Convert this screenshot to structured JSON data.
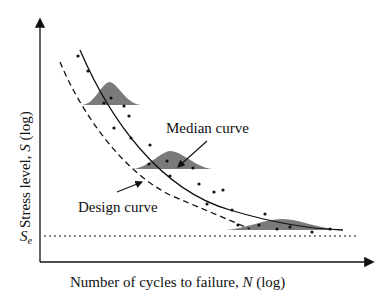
{
  "diagram": {
    "type": "S-N curve (fatigue)",
    "x_axis_label_prefix": "Number of cycles to failure, ",
    "x_axis_var": "N",
    "x_axis_label_suffix": " (log)",
    "y_axis_label_prefix": "Stress level, ",
    "y_axis_var": "S",
    "y_axis_label_suffix": " (log)",
    "endurance_limit_label": "S",
    "endurance_limit_sub": "e",
    "median_curve_label": "Median curve",
    "design_curve_label": "Design curve"
  },
  "colors": {
    "axis": "#111111",
    "curve": "#111111",
    "distribution_fill": "#7a7a7a",
    "points": "#111111"
  }
}
